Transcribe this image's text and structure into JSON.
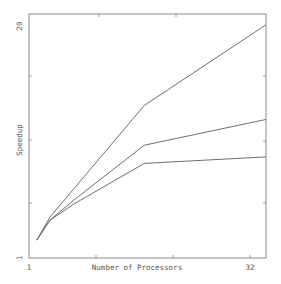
{
  "chart_data": {
    "type": "line",
    "title": "",
    "xlabel": "Number of Processors",
    "ylabel": "Speedup",
    "x_scale": "log2",
    "y_scale": "log",
    "xlim": [
      1,
      41
    ],
    "ylim": [
      1,
      20
    ],
    "x_tick_labels": [
      "1",
      "32"
    ],
    "y_tick_labels": [
      "1",
      "20"
    ],
    "grid": false,
    "legend": null,
    "series": [
      {
        "name": "upper",
        "x": [
          1.13,
          1.39,
          6.1,
          41
        ],
        "y": [
          1.26,
          1.7,
          7.2,
          20.4
        ]
      },
      {
        "name": "middle",
        "x": [
          1.13,
          1.39,
          2.0,
          6.1,
          41
        ],
        "y": [
          1.26,
          1.63,
          2.1,
          4.3,
          6.0
        ]
      },
      {
        "name": "lower",
        "x": [
          1.13,
          1.39,
          2.0,
          6.1,
          41
        ],
        "y": [
          1.26,
          1.63,
          2.0,
          3.4,
          3.7
        ]
      }
    ]
  },
  "axes": {
    "xlabel": "Number of Processors",
    "ylabel": "Speedup",
    "x_min_label": "1",
    "x_max_label": "32",
    "y_min_label": "1",
    "y_max_label": "20"
  }
}
